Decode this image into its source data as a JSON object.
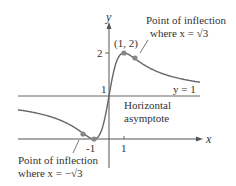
{
  "diagram": {
    "type": "function-graph",
    "function": "f(x) = 1 + 2x/(1+x^2)",
    "axes": {
      "x_label": "x",
      "y_label": "y"
    },
    "ticks": {
      "x": [
        "-1",
        "1"
      ],
      "y": [
        "1",
        "2"
      ]
    },
    "points": {
      "max_point": "(1, 2)",
      "inflection_right_label_line1": "Point of inflection",
      "inflection_right_label_line2": "where x = √3",
      "inflection_left_label_line1": "Point of inflection",
      "inflection_left_label_line2": "where x = −√3"
    },
    "asymptote": {
      "equation": "y = 1",
      "label_line1": "Horizontal",
      "label_line2": "asymptote"
    },
    "colors": {
      "curve": "#666666",
      "axes": "#555555",
      "points": "#888888",
      "text": "#333333"
    }
  }
}
